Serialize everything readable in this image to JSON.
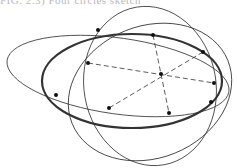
{
  "caption": {
    "text": "FIG. 2.3) Four circles sketch",
    "visible": "partially cut off at top"
  },
  "diagram": {
    "stroke_color": "#333333",
    "bold_ellipse": {
      "cx": 128,
      "cy": 84,
      "rx": 92,
      "ry": 46,
      "rotate": 0
    },
    "thin_ellipses": [
      {
        "cx": 118,
        "cy": 76,
        "rx": 112,
        "ry": 40,
        "rotate": 6
      },
      {
        "cx": 150,
        "cy": 88,
        "rx": 82,
        "ry": 72,
        "rotate": -20
      }
    ],
    "center_point": [
      161,
      74
    ],
    "points": [
      [
        88,
        63
      ],
      [
        153,
        35
      ],
      [
        203,
        52
      ],
      [
        214,
        83
      ],
      [
        169,
        113
      ],
      [
        58,
        94
      ],
      [
        109,
        108
      ]
    ],
    "dashed_lines": [
      [
        [
          88,
          63
        ],
        [
          214,
          83
        ]
      ],
      [
        [
          153,
          35
        ],
        [
          169,
          113
        ]
      ],
      [
        [
          203,
          52
        ],
        [
          109,
          108
        ]
      ]
    ]
  }
}
